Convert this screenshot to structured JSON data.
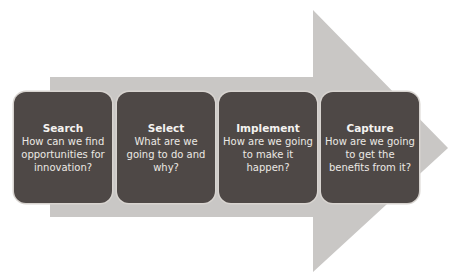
{
  "diagram": {
    "arrow_color": "#c8c6c4",
    "box_color": "#4e4846",
    "steps": [
      {
        "title": "Search",
        "description": "How can we find opportunities for innovation?"
      },
      {
        "title": "Select",
        "description": "What are we going to do and why?"
      },
      {
        "title": "Implement",
        "description": "How are we going to make it happen?"
      },
      {
        "title": "Capture",
        "description": "How are we going to get the benefits from it?"
      }
    ]
  }
}
